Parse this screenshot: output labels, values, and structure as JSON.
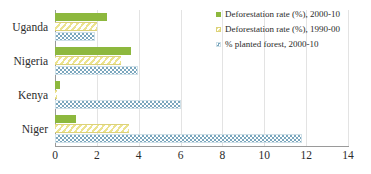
{
  "chart_data": {
    "type": "bar",
    "orientation": "horizontal",
    "title": "",
    "xlabel": "",
    "ylabel": "",
    "xlim": [
      0,
      14
    ],
    "xticks": [
      0,
      2,
      4,
      6,
      8,
      10,
      12,
      14
    ],
    "grid": true,
    "legend_position": "top-right",
    "categories": [
      "Uganda",
      "Nigeria",
      "Kenya",
      "Niger"
    ],
    "series": [
      {
        "name": "Deforestation rate (%), 2000-10",
        "color": "#8db83e",
        "pattern": "solid",
        "values": [
          2.5,
          3.65,
          0.25,
          1.0
        ]
      },
      {
        "name": "Deforestation rate (%), 1990-00",
        "color": "#ece38f",
        "pattern": "diagonal-stripes",
        "values": [
          2.0,
          3.15,
          0.1,
          3.55
        ]
      },
      {
        "name": "% planted forest, 2000-10",
        "color": "#7ba7be",
        "pattern": "checkerboard",
        "values": [
          1.9,
          3.95,
          6.0,
          11.8
        ]
      }
    ]
  },
  "legend": {
    "items": [
      {
        "label": "Deforestation rate (%), 2000-10"
      },
      {
        "label": "Deforestation rate (%), 1990-00"
      },
      {
        "label": "% planted forest, 2000-10"
      }
    ]
  }
}
